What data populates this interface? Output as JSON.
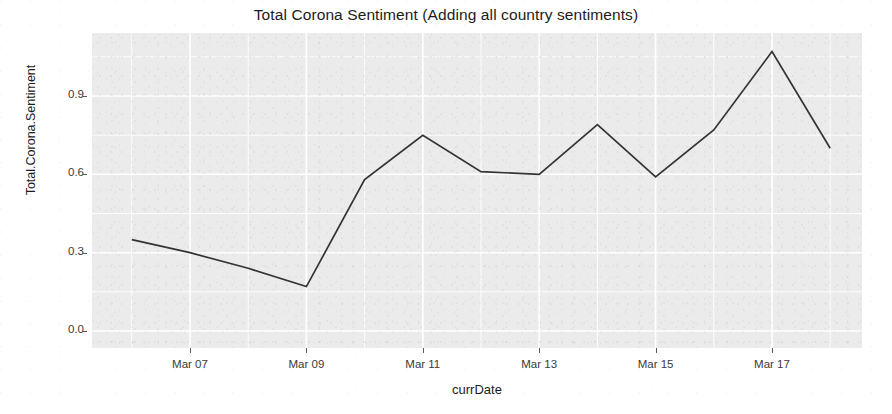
{
  "chart_data": {
    "type": "line",
    "title": "Total Corona Sentiment (Adding all country sentiments)",
    "xlabel": "currDate",
    "ylabel": "Total.Corona.Sentiment",
    "grid": true,
    "legend": "none",
    "x_tick_labels": [
      "Mar 07",
      "Mar 09",
      "Mar 11",
      "Mar 13",
      "Mar 15",
      "Mar 17"
    ],
    "y_tick_labels": [
      "0.0",
      "0.3",
      "0.6",
      "0.9"
    ],
    "y_tick_values": [
      0.0,
      0.3,
      0.6,
      0.9
    ],
    "ylim": [
      -0.06,
      1.15
    ],
    "xlim": [
      "Mar 05",
      "Mar 18.5"
    ],
    "x": [
      "Mar 06",
      "Mar 07",
      "Mar 08",
      "Mar 09",
      "Mar 10",
      "Mar 11",
      "Mar 12",
      "Mar 13",
      "Mar 14",
      "Mar 15",
      "Mar 16",
      "Mar 17",
      "Mar 18"
    ],
    "values": [
      0.35,
      0.3,
      0.24,
      0.17,
      0.58,
      0.75,
      0.61,
      0.6,
      0.79,
      0.59,
      0.77,
      1.07,
      0.7
    ],
    "series": [
      {
        "name": "Total.Corona.Sentiment",
        "color": "#333333",
        "values": [
          0.35,
          0.3,
          0.24,
          0.17,
          0.58,
          0.75,
          0.61,
          0.6,
          0.79,
          0.59,
          0.77,
          1.07,
          0.7
        ]
      }
    ],
    "panel_background": "#ebebeb",
    "gridline_color": "#ffffff",
    "line_color": "#333333"
  }
}
